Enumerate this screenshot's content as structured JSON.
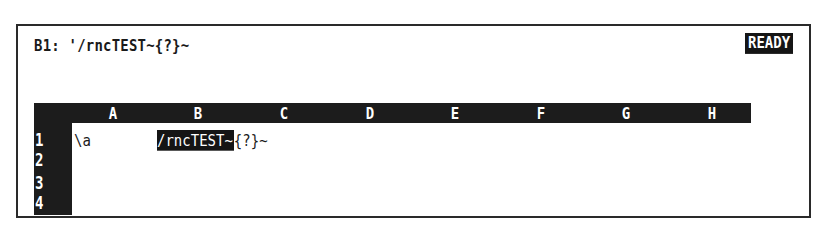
{
  "control_panel": {
    "cell_address": "B1:",
    "cell_contents": "'/rncTEST~{?}~",
    "mode": "READY"
  },
  "worksheet": {
    "columns": [
      "A",
      "B",
      "C",
      "D",
      "E",
      "F",
      "G",
      "H"
    ],
    "rows": [
      "1",
      "2",
      "3",
      "4"
    ],
    "cells": {
      "A1": "\\a",
      "B1_highlighted": "/rncTEST~",
      "B1_overflow": "{?}~"
    },
    "current_cell": "B1"
  }
}
